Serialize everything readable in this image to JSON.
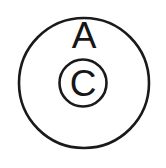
{
  "figure": {
    "background_color": "#ffffff",
    "stroke_color": "#1a1a1a",
    "text_color": "#161616",
    "width": 166,
    "height": 168
  },
  "shapes": {
    "outer_circle": {
      "name": "outer-circle",
      "cx": 84,
      "cy": 83,
      "r": 65,
      "stroke_width": 2.6,
      "fill": "none"
    },
    "inner_circle": {
      "name": "inner-circle",
      "cx": 83,
      "cy": 83,
      "r": 23.5,
      "stroke_width": 2.6,
      "fill": "none"
    }
  },
  "labels": {
    "outer_label": {
      "text": "A",
      "x": 84,
      "y": 48,
      "font_size": 37
    },
    "inner_label": {
      "text": "C",
      "x": 83,
      "y": 96,
      "font_size": 37
    }
  }
}
